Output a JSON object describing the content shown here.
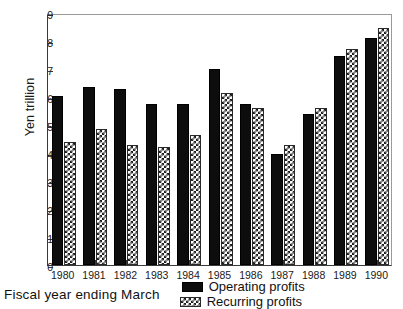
{
  "chart_data": {
    "type": "bar",
    "title": "",
    "subtitle": "",
    "xlabel": "Fiscal year ending March",
    "ylabel": "Yen trillion",
    "categories": [
      "1980",
      "1981",
      "1982",
      "1983",
      "1984",
      "1985",
      "1986",
      "1987",
      "1988",
      "1989",
      "1990"
    ],
    "series": [
      {
        "name": "Operating profits",
        "pattern": "solid-black",
        "values": [
          6.05,
          6.35,
          6.3,
          5.75,
          5.75,
          7.0,
          5.75,
          3.95,
          5.4,
          7.45,
          8.1
        ]
      },
      {
        "name": "Recurring profits",
        "pattern": "cross-hatch",
        "values": [
          4.4,
          4.85,
          4.3,
          4.2,
          4.65,
          6.15,
          5.6,
          4.3,
          5.6,
          7.7,
          8.45
        ]
      }
    ],
    "ylim": [
      0,
      9
    ],
    "yticks": [
      "0",
      "1",
      "2",
      "3",
      "4",
      "5",
      "6",
      "7",
      "8",
      "9"
    ],
    "grid": false,
    "legend_position": "bottom-right",
    "colors": {
      "operating_profits": "#0d0d0d",
      "recurring_profits": "#1c1c1c",
      "axis": "#3a3a3a",
      "background": "#ffffff"
    }
  },
  "legend": {
    "items": [
      {
        "label": "Operating profits",
        "pattern": "solid-black"
      },
      {
        "label": "Recurring profits",
        "pattern": "cross-hatch"
      }
    ]
  }
}
